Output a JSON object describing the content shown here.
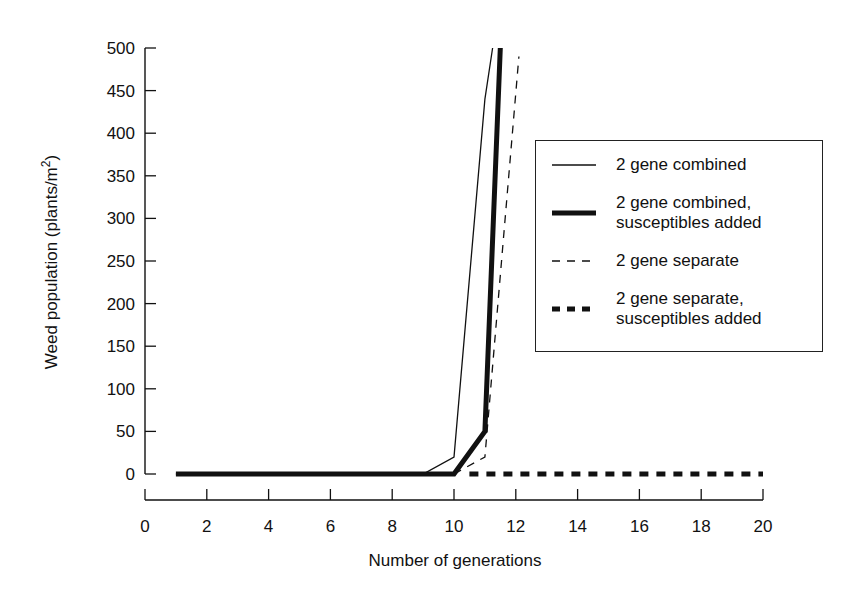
{
  "chart_data": {
    "type": "line",
    "title": "",
    "xlabel": "Number of generations",
    "ylabel": "Weed population (plants/m²)",
    "ylabel_base": "Weed population (plants/m",
    "ylabel_sup": "2",
    "ylabel_close": ")",
    "xlim": [
      0,
      20
    ],
    "ylim": [
      0,
      500
    ],
    "x_ticks": [
      "0",
      "2",
      "4",
      "6",
      "8",
      "10",
      "12",
      "14",
      "16",
      "18",
      "20"
    ],
    "y_ticks": [
      "0",
      "50",
      "100",
      "150",
      "200",
      "250",
      "300",
      "350",
      "400",
      "450",
      "500"
    ],
    "grid": false,
    "legend_position": "right, inside upper-middle",
    "series": [
      {
        "name": "2 gene combined",
        "style": "thin-solid",
        "x": [
          1,
          2,
          3,
          4,
          5,
          6,
          7,
          8,
          9,
          10,
          11,
          11.25
        ],
        "y": [
          0,
          0,
          0,
          0,
          0,
          0,
          0,
          0,
          0,
          20,
          440,
          500
        ]
      },
      {
        "name": "2 gene combined, susceptibles added",
        "style": "thick-solid",
        "x": [
          1,
          2,
          3,
          4,
          5,
          6,
          7,
          8,
          9,
          10,
          11,
          11.5
        ],
        "y": [
          0,
          0,
          0,
          0,
          0,
          0,
          0,
          0,
          0,
          0,
          50,
          500
        ]
      },
      {
        "name": "2 gene separate",
        "style": "thin-dashed",
        "x": [
          10,
          11,
          12.1
        ],
        "y": [
          0,
          20,
          490
        ]
      },
      {
        "name": "2 gene separate, susceptibles added",
        "style": "thick-dotted",
        "x": [
          10.5,
          11,
          12,
          13,
          14,
          15,
          16,
          17,
          18,
          19,
          20
        ],
        "y": [
          0,
          0,
          0,
          0,
          0,
          0,
          0,
          0,
          0,
          0,
          0
        ]
      }
    ]
  },
  "legend": {
    "items": [
      {
        "label": "2 gene combined"
      },
      {
        "label": "2 gene combined,\nsusceptibles added"
      },
      {
        "label": "2 gene separate"
      },
      {
        "label": "2 gene separate,\nsusceptibles added"
      }
    ]
  },
  "colors": {
    "line": "#111111",
    "background": "#ffffff"
  }
}
